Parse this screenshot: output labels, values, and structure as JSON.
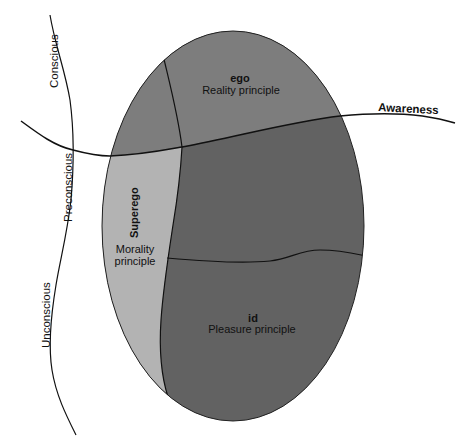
{
  "diagram": {
    "colors": {
      "ego_region": "#7d7d7d",
      "lower_region": "#626262",
      "superego_region": "#b3b3b3",
      "line": "#111111",
      "background": "#ffffff"
    },
    "levels": {
      "conscious": "Conscious",
      "preconscious": "Preconscious",
      "unconscious": "Unconscious",
      "awareness": "Awareness"
    },
    "ego": {
      "name": "ego",
      "principle": "Reality principle"
    },
    "superego": {
      "name": "Superego",
      "principle_line1": "Morality",
      "principle_line2": "principle"
    },
    "id": {
      "name": "id",
      "principle": "Pleasure principle"
    }
  }
}
